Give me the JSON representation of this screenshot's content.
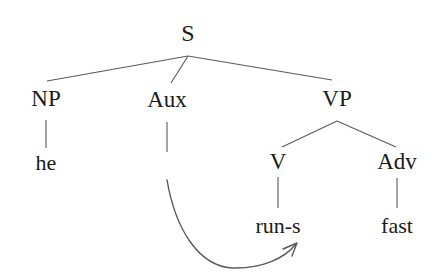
{
  "diagram": {
    "kind": "syntax-tree",
    "canvas": {
      "width": 437,
      "height": 278
    },
    "background_color": "#ffffff",
    "line_color": "#595959",
    "text_color": "#1a1a1a",
    "sentence": "he run-s fast",
    "nodes": [
      {
        "id": "s",
        "label": "S",
        "x": 188,
        "y": 33,
        "level": 0,
        "type": "category"
      },
      {
        "id": "np",
        "label": "NP",
        "x": 46,
        "y": 98,
        "level": 1,
        "type": "category"
      },
      {
        "id": "aux",
        "label": "Aux",
        "x": 167,
        "y": 99,
        "level": 1,
        "type": "category"
      },
      {
        "id": "vp",
        "label": "VP",
        "x": 337,
        "y": 98,
        "level": 1,
        "type": "category"
      },
      {
        "id": "he",
        "label": "he",
        "x": 46,
        "y": 163,
        "level": 2,
        "type": "terminal"
      },
      {
        "id": "v",
        "label": "V",
        "x": 278,
        "y": 161,
        "level": 2,
        "type": "category"
      },
      {
        "id": "adv",
        "label": "Adv",
        "x": 397,
        "y": 161,
        "level": 2,
        "type": "category"
      },
      {
        "id": "runs",
        "label": "run-s",
        "x": 278,
        "y": 226,
        "level": 3,
        "type": "terminal"
      },
      {
        "id": "fast",
        "label": "fast",
        "x": 397,
        "y": 226,
        "level": 3,
        "type": "terminal"
      }
    ],
    "edges": [
      {
        "from": "s",
        "to": "np",
        "kind": "branch"
      },
      {
        "from": "s",
        "to": "aux",
        "kind": "branch"
      },
      {
        "from": "s",
        "to": "vp",
        "kind": "branch"
      },
      {
        "from": "np",
        "to": "he",
        "kind": "stem"
      },
      {
        "from": "aux",
        "to": null,
        "kind": "stem"
      },
      {
        "from": "vp",
        "to": "v",
        "kind": "branch"
      },
      {
        "from": "vp",
        "to": "adv",
        "kind": "branch"
      },
      {
        "from": "v",
        "to": "runs",
        "kind": "stem"
      },
      {
        "from": "adv",
        "to": "fast",
        "kind": "stem"
      }
    ],
    "movement_arrow": {
      "name": "affix-hopping-arrow",
      "from": "aux",
      "to": "runs",
      "start": [
        167,
        180
      ],
      "end": [
        297,
        243
      ],
      "arrowhead": "open-curved"
    }
  }
}
